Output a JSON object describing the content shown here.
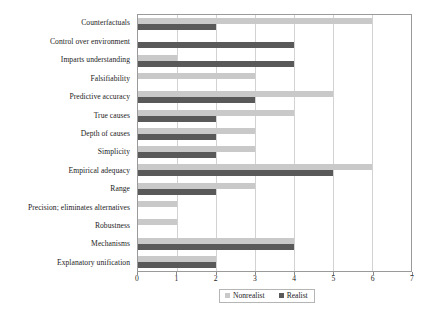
{
  "chart_data": {
    "type": "bar",
    "orientation": "horizontal",
    "title": "",
    "subtitle": "",
    "xlabel": "",
    "ylabel": "",
    "xlim": [
      0,
      7
    ],
    "x_ticks": [
      0,
      1,
      2,
      3,
      4,
      5,
      6,
      7
    ],
    "x_tick_labels": [
      "0",
      "1",
      "2",
      "3",
      "4",
      "5",
      "6",
      "7"
    ],
    "grid": true,
    "grid_axis": "x",
    "legend_position": "bottom-center",
    "categories": [
      "Counterfactuals",
      "Control over environment",
      "Imparts understanding",
      "Falsifiability",
      "Predictive accuracy",
      "True causes",
      "Depth of causes",
      "Simplicity",
      "Empirical adequacy",
      "Range",
      "Precision; eliminates alternatives",
      "Robustness",
      "Mechanisms",
      "Explanatory unification"
    ],
    "series": [
      {
        "name": "Nonrealist",
        "color": "#c9c9c9",
        "values": [
          6,
          0,
          1,
          3,
          5,
          4,
          3,
          3,
          6,
          3,
          1,
          1,
          4,
          2
        ]
      },
      {
        "name": "Realist",
        "color": "#595959",
        "values": [
          2,
          4,
          4,
          0,
          3,
          2,
          2,
          2,
          5,
          2,
          0,
          0,
          4,
          2
        ]
      }
    ]
  },
  "legend": {
    "entries": [
      {
        "label": "Nonrealist",
        "swatch": "nonrealist-swatch"
      },
      {
        "label": "Realist",
        "swatch": "realist-swatch"
      }
    ]
  },
  "colors": {
    "nonrealist": "#c9c9c9",
    "realist": "#595959",
    "frame": "#9a9a9a",
    "gridline": "#d2d2d2",
    "text": "#1c1c1c",
    "background": "#ffffff"
  }
}
